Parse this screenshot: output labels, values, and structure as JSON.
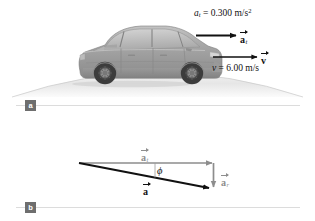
{
  "figure": {
    "background_color": "#ffffff",
    "panels": [
      {
        "badge": "a",
        "description": "car cresting a hill with tangential acceleration and velocity vectors"
      },
      {
        "badge": "b",
        "description": "vector diagram of total acceleration as sum of tangential and radial components"
      }
    ]
  },
  "panel_a": {
    "badge_label": "a",
    "tangential_equation": {
      "symbol": "a",
      "subscript": "t",
      "equals": "=",
      "value": "0.300",
      "unit": "m/s",
      "unit_exponent": "2"
    },
    "velocity_equation": {
      "symbol": "v",
      "equals": "=",
      "value": "6.00",
      "unit": "m/s"
    },
    "arrow_labels": [
      {
        "name": "tangential-acceleration",
        "letter": "a",
        "subscript": "t"
      },
      {
        "name": "velocity",
        "letter": "v",
        "subscript": ""
      }
    ],
    "car_color": "#9a9a9a",
    "hill_color": "#e9e9e9"
  },
  "panel_b": {
    "badge_label": "b",
    "vectors": [
      {
        "name": "tangential-acceleration",
        "letter": "a",
        "subscript": "t",
        "color": "#8d8d8d"
      },
      {
        "name": "radial-acceleration",
        "letter": "a",
        "subscript": "r",
        "color": "#8d8d8d"
      },
      {
        "name": "total-acceleration",
        "letter": "a",
        "subscript": "",
        "color": "#111111"
      }
    ],
    "angle_label": "ϕ",
    "geometry": {
      "origin_x": 79,
      "origin_y": 163,
      "tangential_tip_x": 213,
      "radial_tip_y": 189
    }
  },
  "colors": {
    "vector_gray": "#8d8d8d",
    "vector_black": "#111111",
    "divider": "#d9d9d9",
    "badge_bg": "#6e6e6e"
  }
}
